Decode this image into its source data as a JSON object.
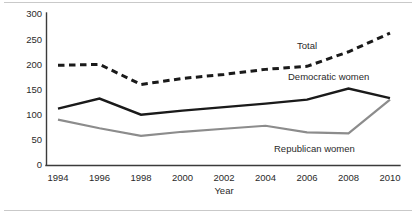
{
  "chart_data": {
    "type": "line",
    "title": "",
    "subtitle": "",
    "xlabel": "Year",
    "ylabel": "",
    "categories": [
      "1994",
      "1996",
      "1998",
      "2000",
      "2002",
      "2004",
      "2006",
      "2008",
      "2010"
    ],
    "x": [
      1994,
      1996,
      1998,
      2000,
      2002,
      2004,
      2006,
      2008,
      2010
    ],
    "xlim": [
      1994,
      2010
    ],
    "ylim": [
      0,
      300
    ],
    "yticks": [
      0,
      50,
      100,
      150,
      200,
      250,
      300
    ],
    "xticks": [
      1994,
      1996,
      1998,
      2000,
      2002,
      2004,
      2006,
      2008,
      2010
    ],
    "grid": false,
    "legend": "inline-annotations",
    "series": [
      {
        "name": "Total",
        "style": "dashed",
        "color": "#1a1a1a",
        "values": [
          198,
          200,
          160,
          172,
          180,
          190,
          196,
          225,
          262
        ]
      },
      {
        "name": "Democratic women",
        "style": "solid",
        "color": "#1a1a1a",
        "values": [
          112,
          132,
          100,
          108,
          115,
          122,
          130,
          152,
          133
        ]
      },
      {
        "name": "Republican women",
        "style": "solid",
        "color": "#8c8c8c",
        "values": [
          90,
          73,
          58,
          66,
          72,
          78,
          65,
          63,
          130
        ]
      }
    ],
    "annotations": [
      {
        "text": "Total",
        "series": "Total"
      },
      {
        "text": "Democratic women",
        "series": "Democratic women"
      },
      {
        "text": "Republican women",
        "series": "Republican women"
      }
    ]
  },
  "axis": {
    "y_tick_labels": [
      "300",
      "250",
      "200",
      "150",
      "100",
      "50",
      "0"
    ],
    "x_tick_labels": [
      "1994",
      "1996",
      "1998",
      "2000",
      "2002",
      "2004",
      "2006",
      "2008",
      "2010"
    ],
    "x_axis_title": "Year"
  },
  "labels": {
    "total": "Total",
    "democratic_women": "Democratic women",
    "republican_women": "Republican women"
  },
  "colors": {
    "total_line": "#1a1a1a",
    "democratic_line": "#1a1a1a",
    "republican_line": "#8c8c8c",
    "axis": "#3b3b3b",
    "frame": "#c9c9c9",
    "text": "#2a2a2a",
    "background": "#ffffff"
  }
}
